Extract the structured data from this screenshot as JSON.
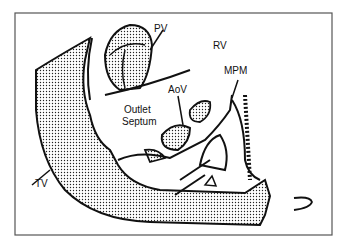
{
  "diagram": {
    "labels": {
      "pv": "PV",
      "rv": "RV",
      "mpm": "MPM",
      "aov": "AoV",
      "outlet_line1": "Outlet",
      "outlet_line2": "Septum",
      "tv": "TV"
    },
    "colors": {
      "frame": "#555555",
      "stroke": "#111111",
      "stipple": "#222222"
    }
  }
}
